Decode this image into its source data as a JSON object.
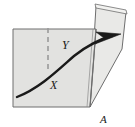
{
  "figure": {
    "caption": "A",
    "background_color": "#ffffff",
    "labels": {
      "angle_upper": "Y",
      "angle_lower": "X",
      "figure_id": "A"
    },
    "colors": {
      "left_plane_fill": "#e2e2e0",
      "right_plane_fill": "#e9e9e7",
      "edge_stroke": "#6e6e6e",
      "ray_stroke": "#1a1a1a",
      "normal_stroke": "#9a9a9a",
      "label_color": "#1a1a1a"
    },
    "elements": {
      "left_plane_name": "left flat plane",
      "right_plane_name": "right tilted plane",
      "fold_edge_name": "fold line between planes",
      "ray_name": "curved ray with arrowhead",
      "normal_name": "dashed normal line",
      "arrow_direction": "up and to the right"
    },
    "geometry": {
      "left_plane_points": "13,29 96,29 90,107 13,107",
      "right_plane_points": "96,6 126,12 122,49 90,107",
      "right_plane_top_strip": "96,6 126,12 127,16 97,10",
      "fold_line": "96,29 90,107",
      "normal_line_x1": 48,
      "normal_line_y1": 28,
      "normal_line_x2": 48,
      "normal_line_y2": 72,
      "ray_path": "M17,97 C40,88 58,70 74,56 C88,44 102,38 116,35",
      "arrow_tip_x": 120,
      "arrow_tip_y": 35,
      "label_y_pos": {
        "x": 62,
        "y": 48
      },
      "label_x_pos": {
        "x": 52,
        "y": 88
      },
      "label_a_pos": {
        "x": 101,
        "y": 122
      }
    }
  }
}
